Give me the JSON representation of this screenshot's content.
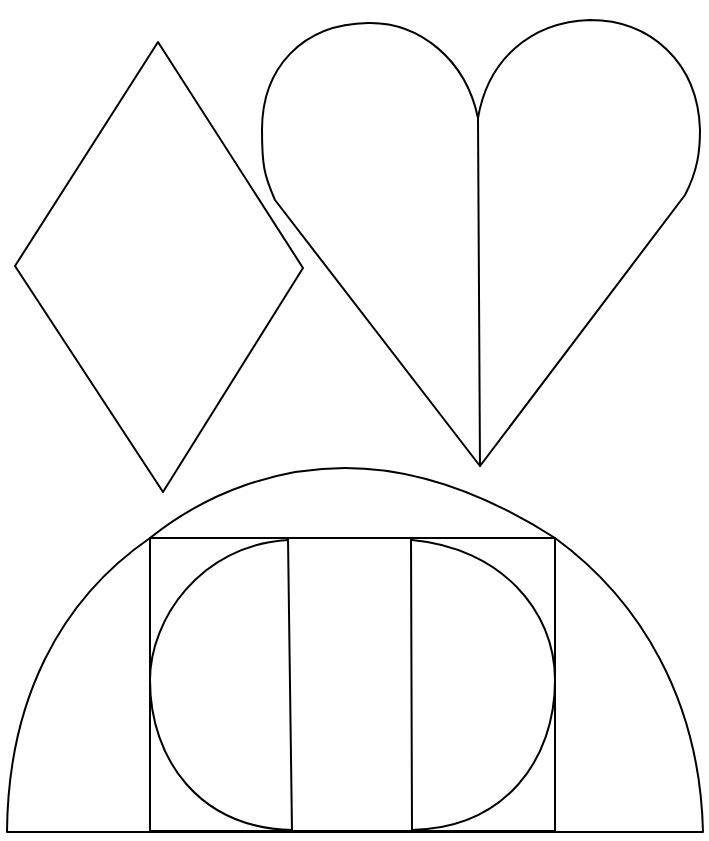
{
  "diagram": {
    "background": "#ffffff",
    "stroke_color": "#000000",
    "shapes": [
      {
        "name": "diamond",
        "description": "rhombus outline"
      },
      {
        "name": "heart",
        "description": "heart outline split by vertical center line"
      },
      {
        "name": "dome",
        "description": "semicircular arch containing a rectangle, circle and vertical dividers"
      }
    ]
  }
}
